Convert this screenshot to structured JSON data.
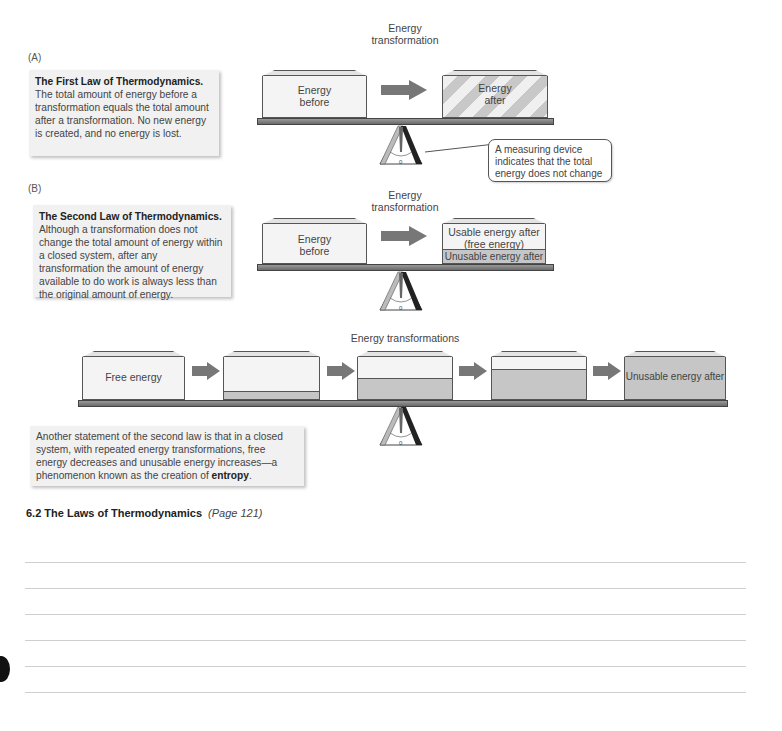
{
  "panel_a": {
    "label": "(A)",
    "note_title": "The First Law of Thermodynamics.",
    "note_body": "The total amount of energy before a transformation equals the total amount after a transformation. No new energy is created, and no energy is lost.",
    "caption_line1": "Energy",
    "caption_line2": "transformation",
    "box_before_line1": "Energy",
    "box_before_line2": "before",
    "box_after_line1": "Energy",
    "box_after_line2": "after",
    "callout": "A measuring device indicates that the total energy does not change",
    "scale_zero": "0"
  },
  "panel_b": {
    "label": "(B)",
    "note_title": "The Second Law of Thermodynamics.",
    "note_body": "Although a transformation does not change the total amount of energy within a closed system, after any transformation the amount of energy available to do work is always less than the original amount of energy.",
    "caption_line1": "Energy",
    "caption_line2": "transformation",
    "box_before_line1": "Energy",
    "box_before_line2": "before",
    "usable_line1": "Usable energy after",
    "usable_line2": "(free energy)",
    "unusable": "Unusable energy after",
    "scale_zero": "0"
  },
  "panel_c": {
    "caption": "Energy transformations",
    "first_box": "Free energy",
    "last_box": "Unusable energy after",
    "note_body_pre": "Another statement of the second law is that in a closed system, with repeated energy transformations, free energy decreases and unusable energy increases—a phenomenon known as the creation of ",
    "note_bold": "entropy",
    "note_end": ".",
    "scale_zero": "0"
  },
  "section": {
    "heading": "6.2  The Laws of Thermodynamics",
    "page_ref": "(Page 121)"
  },
  "colors": {
    "box_fill": "#f4f4f4",
    "unusable_fill": "#c6c6c6",
    "beam": "#7a7a7a",
    "arrow": "#777777",
    "note_bg": "#f1f1f1"
  }
}
